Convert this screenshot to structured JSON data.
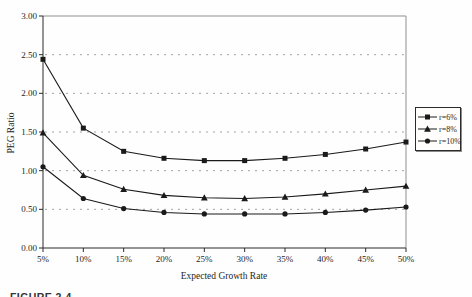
{
  "figure": {
    "caption": "FIGURE 2-4"
  },
  "chart_data": {
    "type": "line",
    "title": "",
    "xlabel": "Expected Growth Rate",
    "ylabel": "PEG Ratio",
    "categories": [
      "5%",
      "10%",
      "15%",
      "20%",
      "25%",
      "30%",
      "35%",
      "40%",
      "45%",
      "50%"
    ],
    "series": [
      {
        "name": "r=6%",
        "marker": "square",
        "color": "#1a1a1a",
        "values": [
          2.44,
          1.55,
          1.25,
          1.16,
          1.13,
          1.13,
          1.16,
          1.21,
          1.28,
          1.37
        ]
      },
      {
        "name": "r=8%",
        "marker": "triangle",
        "color": "#1a1a1a",
        "values": [
          1.49,
          0.94,
          0.76,
          0.68,
          0.65,
          0.64,
          0.66,
          0.7,
          0.75,
          0.8
        ]
      },
      {
        "name": "r=10%",
        "marker": "circle",
        "color": "#1a1a1a",
        "values": [
          1.05,
          0.64,
          0.51,
          0.46,
          0.44,
          0.44,
          0.44,
          0.46,
          0.49,
          0.53
        ]
      }
    ],
    "ylim": [
      0,
      3
    ],
    "ytick_step": 0.5,
    "yticks": [
      "0.00",
      "0.50",
      "1.00",
      "1.50",
      "2.00",
      "2.50",
      "3.00"
    ],
    "grid": "horizontal-dashed",
    "legend_position": "right-middle"
  },
  "colors": {
    "background": "#fefefe",
    "line": "#1a1a1a",
    "grid": "#a3a3a3",
    "frame": "#8f8f8f",
    "axis": "#2b2b2b",
    "text": "#1f1f1f"
  }
}
